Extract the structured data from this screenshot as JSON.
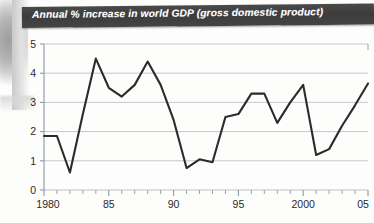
{
  "title": "Annual % increase in world GDP (gross domestic product)",
  "colors": {
    "title_bar": "#3c3c3c",
    "title_text": "#ffffff",
    "plot_line": "#2b2b2b",
    "gridline": "#b9c3cc",
    "axis": "#8a98a5",
    "page": "#fdfdfc"
  },
  "axes": {
    "y_ticks": [
      "0",
      "1",
      "2",
      "3",
      "4",
      "5"
    ],
    "x_ticks": [
      "1980",
      "85",
      "90",
      "95",
      "2000",
      "05"
    ]
  },
  "chart_data": {
    "type": "line",
    "title": "Annual % increase in world GDP (gross domestic product)",
    "xlabel": "",
    "ylabel": "",
    "ylim": [
      0,
      5
    ],
    "xlim": [
      1980,
      2005
    ],
    "grid": true,
    "legend": false,
    "x": [
      1980,
      1981,
      1982,
      1983,
      1984,
      1985,
      1986,
      1987,
      1988,
      1989,
      1990,
      1991,
      1992,
      1993,
      1994,
      1995,
      1996,
      1997,
      1998,
      1999,
      2000,
      2001,
      2002,
      2003,
      2004,
      2005
    ],
    "values": [
      1.85,
      1.85,
      0.6,
      2.6,
      4.5,
      3.5,
      3.2,
      3.6,
      4.4,
      3.6,
      2.4,
      0.75,
      1.05,
      0.95,
      2.5,
      2.6,
      3.3,
      3.3,
      2.3,
      3.0,
      3.6,
      1.2,
      1.4,
      2.2,
      2.9,
      3.65
    ],
    "x_tick_labels": [
      "1980",
      "85",
      "90",
      "95",
      "2000",
      "05"
    ],
    "x_tick_values": [
      1980,
      1985,
      1990,
      1995,
      2000,
      2005
    ],
    "y_tick_values": [
      0,
      1,
      2,
      3,
      4,
      5
    ]
  }
}
